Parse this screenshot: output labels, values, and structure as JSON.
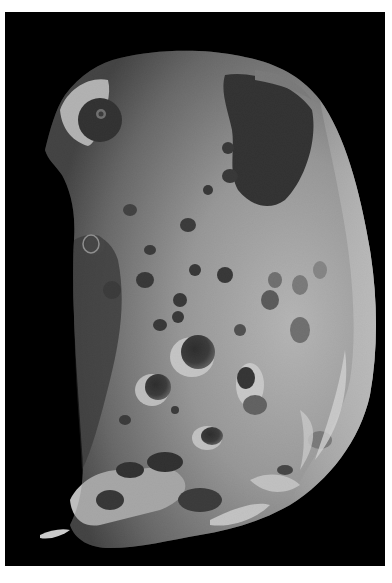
{
  "image": {
    "subject": "cratered moon",
    "description": "Grayscale photograph of a heavily cratered irregular moon lit from the right, on a black background with a thin white border",
    "colors": {
      "border": "#ffffff",
      "background": "#000000",
      "surface_light": "#d9d9d9",
      "surface_mid": "#8c8c8c",
      "surface_dark": "#3a3a3a",
      "shadow": "#0a0a0a"
    }
  }
}
